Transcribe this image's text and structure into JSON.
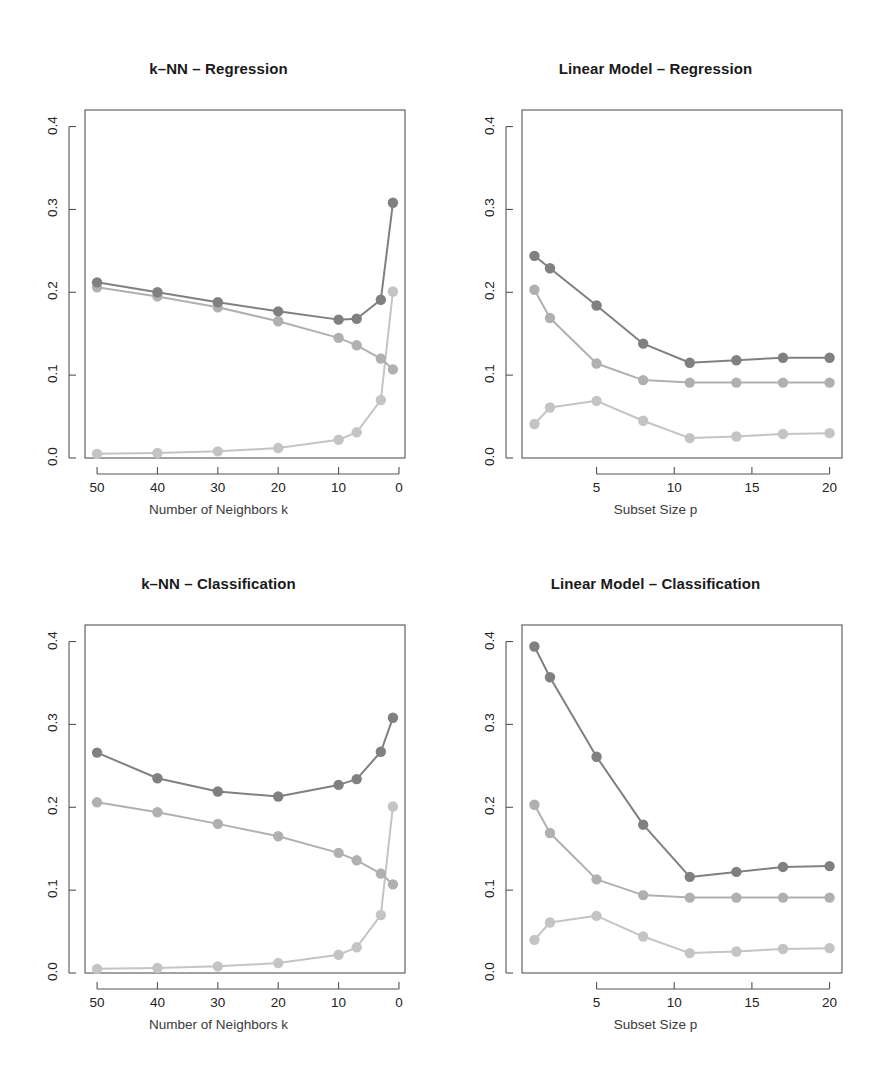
{
  "figure": {
    "background": "#ffffff",
    "width": 874,
    "height": 1086
  },
  "palette": {
    "series_dark": "#808080",
    "series_mid": "#b0b0b0",
    "series_light": "#c4c4c4",
    "axis": "#555555",
    "text": "#1a1a1a"
  },
  "panels": [
    {
      "key": "knn_regression",
      "title": "k–NN – Regression",
      "xlabel": "Number of Neighbors k",
      "ylabel": ""
    },
    {
      "key": "lm_regression",
      "title": "Linear Model – Regression",
      "xlabel": "Subset Size p",
      "ylabel": ""
    },
    {
      "key": "knn_classification",
      "title": "k–NN – Classification",
      "xlabel": "Number of Neighbors k",
      "ylabel": ""
    },
    {
      "key": "lm_classification",
      "title": "Linear Model – Classification",
      "xlabel": "Subset Size p",
      "ylabel": ""
    }
  ],
  "chart_data": [
    {
      "type": "line",
      "key": "knn_regression",
      "title": "k–NN – Regression",
      "xlabel": "Number of Neighbors k",
      "ylabel": "",
      "xlim": [
        52,
        -1
      ],
      "ylim": [
        0.0,
        0.42
      ],
      "x_reversed": true,
      "grid": false,
      "legend": "none",
      "xticks": [
        50,
        40,
        30,
        20,
        10,
        0
      ],
      "yticks": [
        0.0,
        0.1,
        0.2,
        0.3,
        0.4
      ],
      "x": [
        50,
        40,
        30,
        20,
        10,
        7,
        3,
        1
      ],
      "series": [
        {
          "name": "dark",
          "color": "#808080",
          "values": [
            0.212,
            0.2,
            0.188,
            0.177,
            0.167,
            0.168,
            0.191,
            0.308
          ]
        },
        {
          "name": "mid",
          "color": "#b0b0b0",
          "values": [
            0.206,
            0.195,
            0.182,
            0.165,
            0.145,
            0.136,
            0.12,
            0.107
          ]
        },
        {
          "name": "light",
          "color": "#c4c4c4",
          "values": [
            0.005,
            0.006,
            0.008,
            0.012,
            0.022,
            0.031,
            0.07,
            0.201
          ]
        }
      ]
    },
    {
      "type": "line",
      "key": "lm_regression",
      "title": "Linear Model – Regression",
      "xlabel": "Subset Size p",
      "ylabel": "",
      "xlim": [
        0.2,
        20.8
      ],
      "ylim": [
        0.0,
        0.42
      ],
      "x_reversed": false,
      "grid": false,
      "legend": "none",
      "xticks": [
        5,
        10,
        15,
        20
      ],
      "yticks": [
        0.0,
        0.1,
        0.2,
        0.3,
        0.4
      ],
      "x": [
        1,
        2,
        5,
        8,
        11,
        14,
        17,
        20
      ],
      "series": [
        {
          "name": "dark",
          "color": "#808080",
          "values": [
            0.244,
            0.229,
            0.184,
            0.138,
            0.115,
            0.118,
            0.121,
            0.121
          ]
        },
        {
          "name": "mid",
          "color": "#b0b0b0",
          "values": [
            0.203,
            0.169,
            0.114,
            0.094,
            0.091,
            0.091,
            0.091,
            0.091
          ]
        },
        {
          "name": "light",
          "color": "#c4c4c4",
          "values": [
            0.041,
            0.061,
            0.069,
            0.045,
            0.024,
            0.026,
            0.029,
            0.03
          ]
        }
      ]
    },
    {
      "type": "line",
      "key": "knn_classification",
      "title": "k–NN – Classification",
      "xlabel": "Number of Neighbors k",
      "ylabel": "",
      "xlim": [
        52,
        -1
      ],
      "ylim": [
        0.0,
        0.42
      ],
      "x_reversed": true,
      "grid": false,
      "legend": "none",
      "xticks": [
        50,
        40,
        30,
        20,
        10,
        0
      ],
      "yticks": [
        0.0,
        0.1,
        0.2,
        0.3,
        0.4
      ],
      "x": [
        50,
        40,
        30,
        20,
        10,
        7,
        3,
        1
      ],
      "series": [
        {
          "name": "dark",
          "color": "#808080",
          "values": [
            0.266,
            0.235,
            0.219,
            0.213,
            0.227,
            0.234,
            0.267,
            0.308
          ]
        },
        {
          "name": "mid",
          "color": "#b0b0b0",
          "values": [
            0.206,
            0.194,
            0.18,
            0.165,
            0.145,
            0.136,
            0.12,
            0.107
          ]
        },
        {
          "name": "light",
          "color": "#c4c4c4",
          "values": [
            0.005,
            0.006,
            0.008,
            0.012,
            0.022,
            0.031,
            0.07,
            0.201
          ]
        }
      ]
    },
    {
      "type": "line",
      "key": "lm_classification",
      "title": "Linear Model – Classification",
      "xlabel": "Subset Size p",
      "ylabel": "",
      "xlim": [
        0.2,
        20.8
      ],
      "ylim": [
        0.0,
        0.42
      ],
      "x_reversed": false,
      "grid": false,
      "legend": "none",
      "xticks": [
        5,
        10,
        15,
        20
      ],
      "yticks": [
        0.0,
        0.1,
        0.2,
        0.3,
        0.4
      ],
      "x": [
        1,
        2,
        5,
        8,
        11,
        14,
        17,
        20
      ],
      "series": [
        {
          "name": "dark",
          "color": "#808080",
          "values": [
            0.394,
            0.357,
            0.261,
            0.179,
            0.116,
            0.122,
            0.128,
            0.129
          ]
        },
        {
          "name": "mid",
          "color": "#b0b0b0",
          "values": [
            0.203,
            0.169,
            0.113,
            0.094,
            0.091,
            0.091,
            0.091,
            0.091
          ]
        },
        {
          "name": "light",
          "color": "#c4c4c4",
          "values": [
            0.04,
            0.061,
            0.069,
            0.044,
            0.024,
            0.026,
            0.029,
            0.03
          ]
        }
      ]
    }
  ]
}
